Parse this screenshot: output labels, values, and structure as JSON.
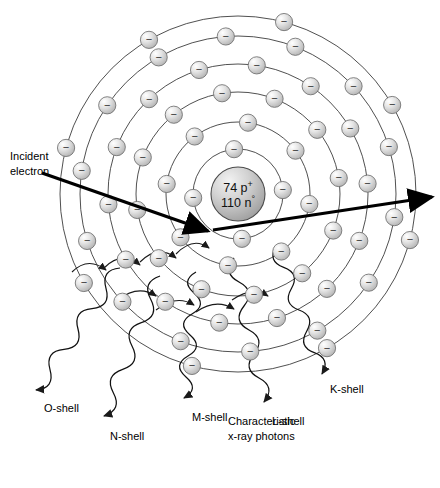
{
  "figure": {
    "background_color": "#ffffff",
    "line_color": "#3c3c3c",
    "arrow_color": "#000000",
    "electron_fill": "#d9d9d9",
    "nucleus_fill": "#c9c9c9"
  },
  "nucleus": {
    "protons": "74 p",
    "protons_sign": "+",
    "neutrons": "110 n",
    "neutrons_sign": "°",
    "center_x": 238,
    "center_y": 194,
    "radius": 27
  },
  "incident": {
    "label_line1": "Incident",
    "label_line2": "electron",
    "label_x": 10,
    "label_y": 160
  },
  "caption": {
    "line1": "Characteristic",
    "line2": "x-ray photons",
    "x": 228,
    "y": 425
  },
  "shells": [
    {
      "name": "K-shell",
      "index": 1,
      "radius": 45,
      "electrons": 4
    },
    {
      "name": "L-shell",
      "index": 2,
      "radius": 72,
      "electrons": 8
    },
    {
      "name": "M-shell",
      "index": 3,
      "radius": 102,
      "electrons": 12
    },
    {
      "name": "N-shell",
      "index": 4,
      "radius": 130,
      "electrons": 14
    },
    {
      "name": "O-shell",
      "index": 5,
      "radius": 158,
      "electrons": 14
    },
    {
      "name": "P-shell",
      "index": 6,
      "radius": 178,
      "electrons": 8
    }
  ],
  "photon_labels": [
    {
      "text": "O-shell",
      "x": 44,
      "y": 412,
      "arrow_x": 38,
      "arrow_y": 392
    },
    {
      "text": "N-shell",
      "x": 110,
      "y": 440,
      "arrow_x": 104,
      "arrow_y": 418
    },
    {
      "text": "M-shell",
      "x": 192,
      "y": 421,
      "arrow_x": 186,
      "arrow_y": 400
    },
    {
      "text": "L-shell",
      "x": 272,
      "y": 425,
      "arrow_x": 266,
      "arrow_y": 404
    },
    {
      "text": "K-shell",
      "x": 330,
      "y": 393,
      "arrow_x": 324,
      "arrow_y": 377
    }
  ],
  "electron_symbol": "−"
}
